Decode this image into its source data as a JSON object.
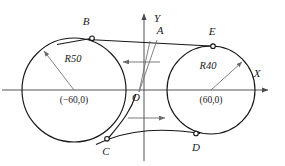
{
  "figure": {
    "background_color": "#ffffff",
    "line_color": "#171717",
    "axis_color": "#4a4a4a",
    "leader_color": "#6b6b6b"
  },
  "axes": {
    "x_label": "X",
    "y_label": "Y",
    "origin_label": "O",
    "origin_px": [
      144,
      90
    ]
  },
  "circles": [
    {
      "id": "left",
      "radius_label": "R50",
      "center_label": "(−60,0)",
      "center_px": [
        74,
        90
      ],
      "radius_px": 52
    },
    {
      "id": "right",
      "radius_label": "R40",
      "center_label": "(60,0)",
      "center_px": [
        211,
        90
      ],
      "radius_px": 44
    }
  ],
  "points": [
    {
      "id": "B",
      "label": "B",
      "px": [
        92,
        38
      ]
    },
    {
      "id": "A",
      "label": "A",
      "px": [
        158,
        33
      ]
    },
    {
      "id": "E",
      "label": "E",
      "px": [
        211,
        46
      ]
    },
    {
      "id": "C",
      "label": "C",
      "px": [
        108,
        138
      ]
    },
    {
      "id": "D",
      "label": "D",
      "px": [
        196,
        134
      ]
    }
  ],
  "flow_arrows": [
    {
      "id": "upper",
      "direction": "left",
      "label": ""
    },
    {
      "id": "lower",
      "direction": "right",
      "label": ""
    }
  ]
}
